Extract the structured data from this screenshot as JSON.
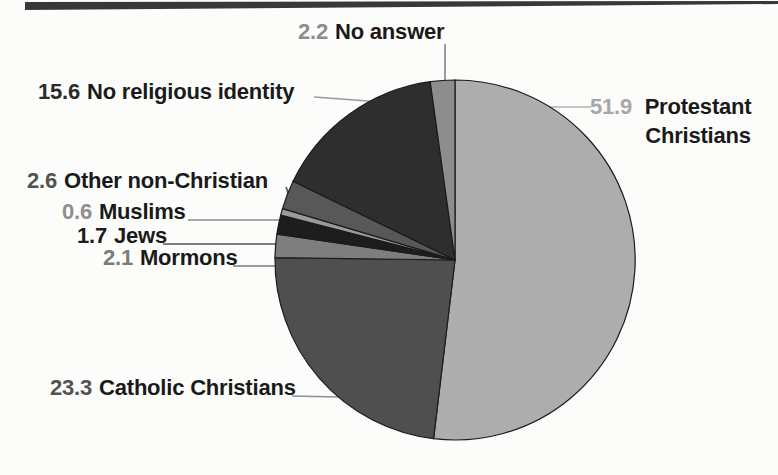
{
  "page": {
    "background": "#fcfcfa",
    "top_bar_color": "#383838"
  },
  "chart_data": {
    "type": "pie",
    "title": "",
    "unit": "percent",
    "total": 100,
    "start_angle_deg": 0,
    "direction": "clockwise",
    "center": {
      "x": 455,
      "y": 260
    },
    "radius": 180,
    "stroke_color": "#1b1b1b",
    "legend_position": "callout-labels",
    "slices": [
      {
        "key": "protestant-christians",
        "label": "Protestant Christians",
        "value": 51.9,
        "color": "#adadad",
        "num_color": "#a7a7a7",
        "leader_color": "#b2b2b2",
        "label_pos": {
          "x": 590,
          "y": 93,
          "anchor": "left",
          "valign": "top",
          "wrap_width": 118
        },
        "leader": {
          "x1": 549,
          "y1": 107,
          "x2": 591,
          "y2": 107
        }
      },
      {
        "key": "catholic-christians",
        "label": "Catholic Christians",
        "value": 23.3,
        "color": "#4f4f4f",
        "num_color": "#525252",
        "leader_color": "#909090",
        "label_pos": {
          "x": 50,
          "y": 388,
          "anchor": "left"
        },
        "leader": {
          "x1": 292,
          "y1": 396,
          "x2": 339,
          "y2": 397
        }
      },
      {
        "key": "mormons",
        "label": "Mormons",
        "value": 2.1,
        "color": "#7e7e7e",
        "num_color": "#7b7b7b",
        "leader_color": "#7b7b7b",
        "label_pos": {
          "x": 103,
          "y": 258,
          "anchor": "left"
        },
        "leader": {
          "x1": 233,
          "y1": 266,
          "x2": 276,
          "y2": 266
        }
      },
      {
        "key": "jews",
        "label": "Jews",
        "value": 1.7,
        "color": "#1d1d1d",
        "num_color": "#1d1d1d",
        "leader_color": "#555555",
        "label_pos": {
          "x": 77,
          "y": 236,
          "anchor": "left"
        },
        "leader": {
          "x1": 163,
          "y1": 244,
          "x2": 277,
          "y2": 244
        }
      },
      {
        "key": "muslims",
        "label": "Muslims",
        "value": 0.6,
        "color": "#9a9a9a",
        "num_color": "#8f8f8f",
        "leader_color": "#8a8a8a",
        "label_pos": {
          "x": 62,
          "y": 212,
          "anchor": "left"
        },
        "leader": {
          "x1": 188,
          "y1": 220,
          "x2": 281,
          "y2": 220
        }
      },
      {
        "key": "other-non-christian",
        "label": "Other non-Christian",
        "value": 2.6,
        "color": "#585858",
        "num_color": "#525252",
        "leader_color": "#555555",
        "label_pos": {
          "x": 27,
          "y": 181,
          "anchor": "left"
        },
        "leader": {
          "x1": 286,
          "y1": 187,
          "x2": 293,
          "y2": 206
        }
      },
      {
        "key": "no-religious-identity",
        "label": "No religious identity",
        "value": 15.6,
        "color": "#2e2e2e",
        "num_color": "#2b2b2b",
        "leader_color": "#9a9a9a",
        "label_pos": {
          "x": 38,
          "y": 92,
          "anchor": "left"
        },
        "leader": {
          "x1": 314,
          "y1": 97,
          "x2": 381,
          "y2": 102
        }
      },
      {
        "key": "no-answer",
        "label": "No answer",
        "value": 2.2,
        "color": "#8d8d8d",
        "num_color": "#8c8c8c",
        "leader_color": "#8a8a8a",
        "label_pos": {
          "x": 298,
          "y": 32,
          "anchor": "left"
        },
        "leader": {
          "x1": 445,
          "y1": 44,
          "x2": 445,
          "y2": 80
        }
      }
    ]
  }
}
